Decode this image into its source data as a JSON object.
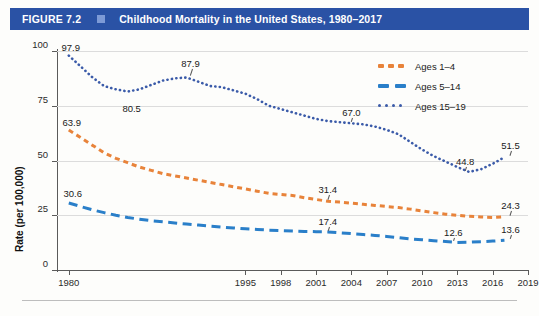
{
  "figure": {
    "number_label": "FIGURE 7.2",
    "marker_icon": "square-marker-icon",
    "title": "Childhood Mortality in the United States, 1980–2017"
  },
  "colors": {
    "title_bar": "#2a52a5",
    "title_square": "#7d9ad6",
    "ages_1_4": "#e8833a",
    "ages_5_14": "#2a7fc9",
    "ages_15_19": "#3b5ba9",
    "grid": "#dcdcdc",
    "axis": "#5a5a5a",
    "background": "#fdfdfb"
  },
  "legend": {
    "position": "top-right",
    "items": [
      {
        "label": "Ages 1–4",
        "color": "#e8833a",
        "style": "dashed-short",
        "icon": "legend-swatch-icon"
      },
      {
        "label": "Ages 5–14",
        "color": "#2a7fc9",
        "style": "dashed-long",
        "icon": "legend-swatch-icon"
      },
      {
        "label": "Ages 15–19",
        "color": "#3b5ba9",
        "style": "dotted",
        "icon": "legend-swatch-icon"
      }
    ]
  },
  "axes": {
    "ylabel": "Rate (per 100,000)",
    "yticks": [
      "0",
      "25",
      "50",
      "75",
      "100"
    ],
    "ylim": [
      0,
      100
    ],
    "xticks": [
      "1980",
      "1995",
      "1998",
      "2001",
      "2004",
      "2007",
      "2010",
      "2013",
      "2016",
      "2019"
    ],
    "xlim": [
      1979,
      2019
    ],
    "grid": true,
    "xlabel": ""
  },
  "chart_data": {
    "type": "line",
    "title": "Childhood Mortality in the United States, 1980–2017",
    "xlabel": "",
    "ylabel": "Rate (per 100,000)",
    "ylim": [
      0,
      100
    ],
    "xlim": [
      1979,
      2019
    ],
    "grid": true,
    "legend_position": "top-right",
    "x": [
      1980,
      1981,
      1982,
      1983,
      1984,
      1985,
      1986,
      1987,
      1988,
      1989,
      1990,
      1991,
      1992,
      1993,
      1994,
      1995,
      1996,
      1997,
      1998,
      1999,
      2000,
      2001,
      2002,
      2003,
      2004,
      2005,
      2006,
      2007,
      2008,
      2009,
      2010,
      2011,
      2012,
      2013,
      2014,
      2015,
      2016,
      2017
    ],
    "series": [
      {
        "name": "Ages 1–4",
        "color": "#e8833a",
        "style": "dashed-short",
        "values": [
          63.9,
          60.5,
          57.0,
          53.5,
          51.0,
          49.0,
          47.0,
          45.5,
          44.0,
          43.0,
          42.0,
          41.0,
          40.0,
          39.0,
          38.0,
          37.0,
          36.0,
          35.0,
          34.5,
          34.0,
          33.0,
          32.2,
          31.4,
          31.0,
          30.5,
          30.0,
          29.5,
          29.0,
          28.5,
          27.8,
          27.0,
          26.2,
          25.5,
          25.0,
          24.5,
          24.2,
          24.0,
          24.3
        ],
        "labeled_points": [
          {
            "x": 1980,
            "y": 63.9,
            "label": "63.9"
          },
          {
            "x": 2002,
            "y": 31.4,
            "label": "31.4"
          },
          {
            "x": 2017,
            "y": 24.3,
            "label": "24.3"
          }
        ]
      },
      {
        "name": "Ages 5–14",
        "color": "#2a7fc9",
        "style": "dashed-long",
        "values": [
          30.6,
          29.0,
          27.5,
          26.2,
          25.0,
          24.0,
          23.2,
          22.5,
          22.0,
          21.5,
          21.0,
          20.5,
          20.0,
          19.6,
          19.2,
          18.8,
          18.5,
          18.2,
          18.0,
          17.8,
          17.6,
          17.5,
          17.4,
          17.0,
          16.6,
          16.2,
          15.8,
          15.3,
          14.8,
          14.2,
          13.8,
          13.4,
          13.0,
          12.6,
          12.7,
          12.9,
          13.2,
          13.6
        ],
        "labeled_points": [
          {
            "x": 1980,
            "y": 30.6,
            "label": "30.6"
          },
          {
            "x": 2002,
            "y": 17.4,
            "label": "17.4"
          },
          {
            "x": 2013,
            "y": 12.6,
            "label": "12.6"
          },
          {
            "x": 2017,
            "y": 13.6,
            "label": "13.6"
          }
        ]
      },
      {
        "name": "Ages 15–19",
        "color": "#3b5ba9",
        "style": "dotted",
        "values": [
          97.9,
          93.0,
          88.0,
          84.0,
          82.5,
          81.5,
          82.5,
          84.5,
          86.5,
          87.5,
          87.9,
          86.0,
          84.0,
          83.5,
          82.0,
          80.5,
          78.0,
          75.0,
          73.5,
          72.0,
          70.5,
          69.0,
          68.0,
          67.5,
          67.0,
          66.5,
          65.5,
          64.0,
          62.0,
          58.5,
          55.0,
          52.0,
          49.5,
          47.0,
          44.8,
          46.0,
          48.5,
          51.5
        ],
        "labeled_points": [
          {
            "x": 1980,
            "y": 97.9,
            "label": "97.9"
          },
          {
            "x": 1985,
            "y": 80.5,
            "label": "80.5"
          },
          {
            "x": 1990,
            "y": 87.9,
            "label": "87.9"
          },
          {
            "x": 2004,
            "y": 67.0,
            "label": "67.0"
          },
          {
            "x": 2014,
            "y": 44.8,
            "label": "44.8"
          },
          {
            "x": 2017,
            "y": 51.5,
            "label": "51.5"
          }
        ]
      }
    ]
  }
}
